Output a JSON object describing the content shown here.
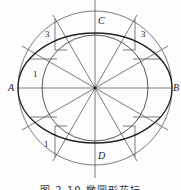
{
  "diagram": {
    "points": {
      "A": "A",
      "B": "B",
      "C": "C",
      "D": "D"
    },
    "region_labels": {
      "top_left": "3",
      "top_right": "3",
      "mid_left": "1",
      "bottom_left": "1"
    },
    "caption": "图 2.10  椭圆形花坛",
    "colors": {
      "line": "#333333",
      "background": "#fdfdfd"
    }
  }
}
